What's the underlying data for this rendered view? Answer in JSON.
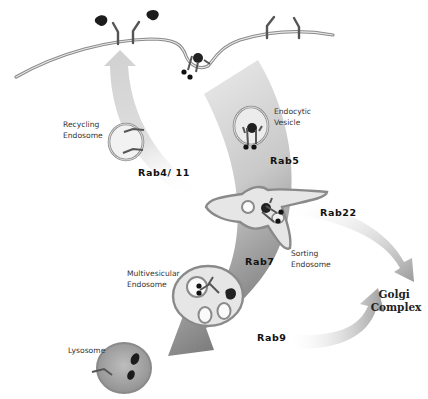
{
  "diagram": {
    "compartments": {
      "recycling_endosome": "Recycling\nEndosome",
      "recycling_line1": "Recycling",
      "recycling_line2": "Endosome",
      "endocytic_vesicle_line1": "Endocytic",
      "endocytic_vesicle_line2": "Vesicle",
      "sorting_endosome_line1": "Sorting",
      "sorting_endosome_line2": "Endosome",
      "multivesicular_line1": "Multivesicular",
      "multivesicular_line2": "Endosome",
      "lysosome": "Lysosome",
      "golgi_line1": "Golgi",
      "golgi_line2": "Complex"
    },
    "rabs": {
      "recycling": "Rab4/ 11",
      "early": "Rab5",
      "golgi_export": "Rab22",
      "late": "Rab7",
      "golgi_return": "Rab9"
    },
    "colors": {
      "arrow_light": "#e6e6e6",
      "arrow_dark": "#8a8a8a",
      "membrane": "#888888",
      "vesicle_fill": "#e4e4e4",
      "ligand": "#1a1a1a"
    }
  }
}
